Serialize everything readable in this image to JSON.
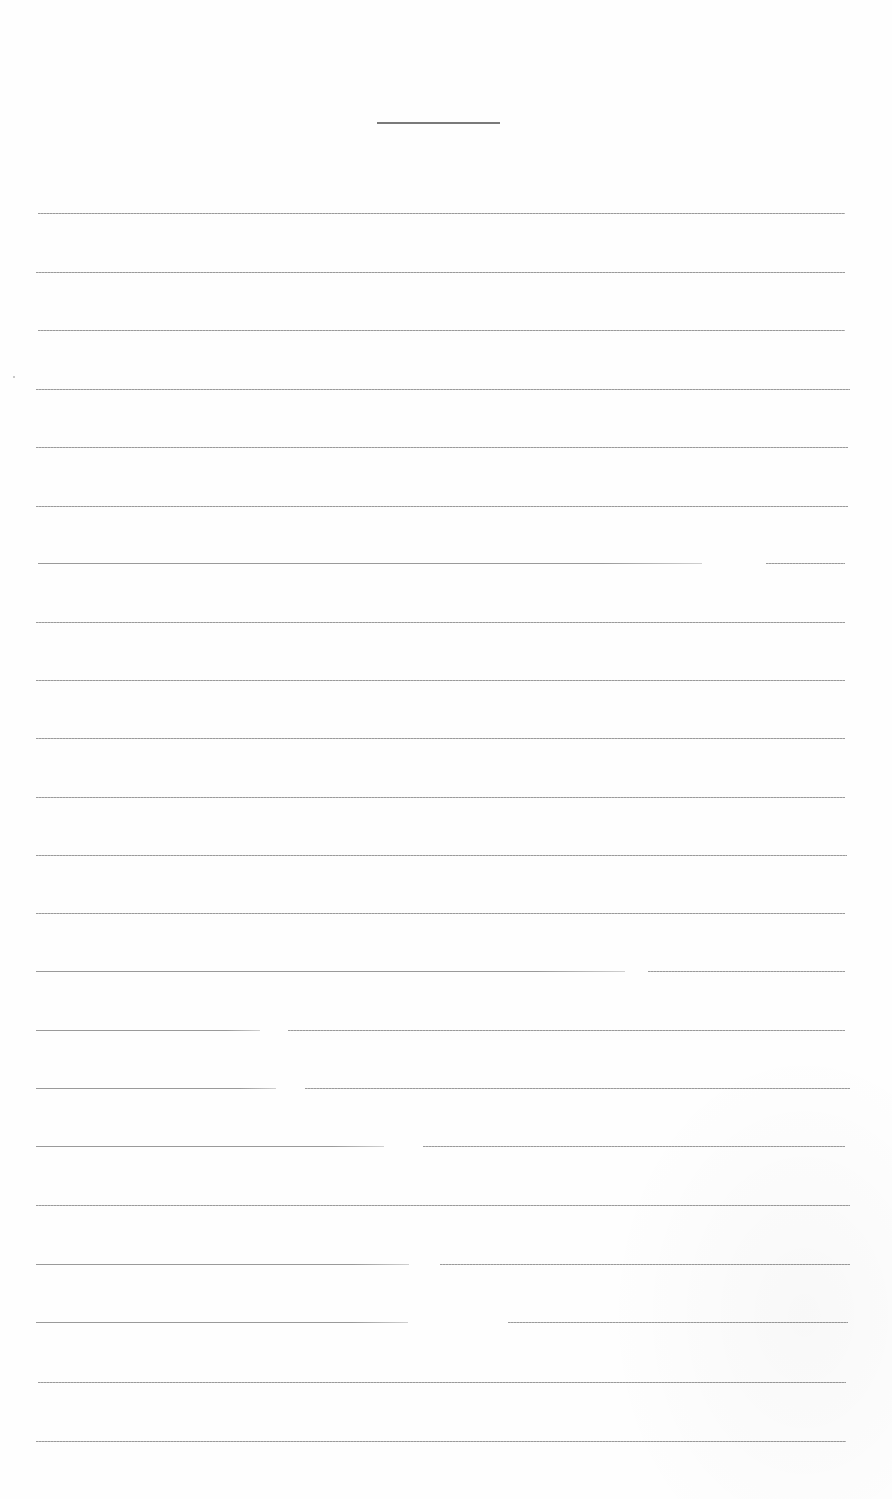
{
  "document": {
    "type": "lined-paper",
    "title_line": {
      "x": 377,
      "y": 122,
      "width": 123
    },
    "colors": {
      "paper": "#fefefe",
      "rule": "#9a9a9a",
      "title_rule": "#7a7a7a"
    },
    "rules": [
      {
        "y": 213,
        "x1": 38,
        "x2": 845,
        "gaps": []
      },
      {
        "y": 272,
        "x1": 36,
        "x2": 845,
        "gaps": []
      },
      {
        "y": 330,
        "x1": 38,
        "x2": 845,
        "gaps": []
      },
      {
        "y": 389,
        "x1": 36,
        "x2": 850,
        "gaps": []
      },
      {
        "y": 447,
        "x1": 36,
        "x2": 848,
        "gaps": []
      },
      {
        "y": 506,
        "x1": 36,
        "x2": 848,
        "gaps": []
      },
      {
        "y": 563,
        "x1": 38,
        "x2": 845,
        "gaps": [
          [
            702,
            766
          ]
        ]
      },
      {
        "y": 622,
        "x1": 36,
        "x2": 845,
        "gaps": []
      },
      {
        "y": 680,
        "x1": 36,
        "x2": 845,
        "gaps": []
      },
      {
        "y": 738,
        "x1": 36,
        "x2": 845,
        "gaps": []
      },
      {
        "y": 797,
        "x1": 36,
        "x2": 845,
        "gaps": []
      },
      {
        "y": 855,
        "x1": 36,
        "x2": 847,
        "gaps": []
      },
      {
        "y": 913,
        "x1": 36,
        "x2": 845,
        "gaps": []
      },
      {
        "y": 971,
        "x1": 36,
        "x2": 845,
        "gaps": [
          [
            625,
            648
          ]
        ]
      },
      {
        "y": 1030,
        "x1": 36,
        "x2": 845,
        "gaps": [
          [
            260,
            288
          ]
        ]
      },
      {
        "y": 1088,
        "x1": 36,
        "x2": 850,
        "gaps": [
          [
            276,
            305
          ]
        ]
      },
      {
        "y": 1146,
        "x1": 36,
        "x2": 845,
        "gaps": [
          [
            384,
            423
          ]
        ]
      },
      {
        "y": 1205,
        "x1": 36,
        "x2": 850,
        "gaps": []
      },
      {
        "y": 1264,
        "x1": 36,
        "x2": 850,
        "gaps": [
          [
            409,
            440
          ]
        ]
      },
      {
        "y": 1322,
        "x1": 36,
        "x2": 848,
        "gaps": [
          [
            408,
            508
          ]
        ]
      },
      {
        "y": 1382,
        "x1": 38,
        "x2": 846,
        "gaps": []
      },
      {
        "y": 1441,
        "x1": 36,
        "x2": 846,
        "gaps": []
      }
    ]
  }
}
